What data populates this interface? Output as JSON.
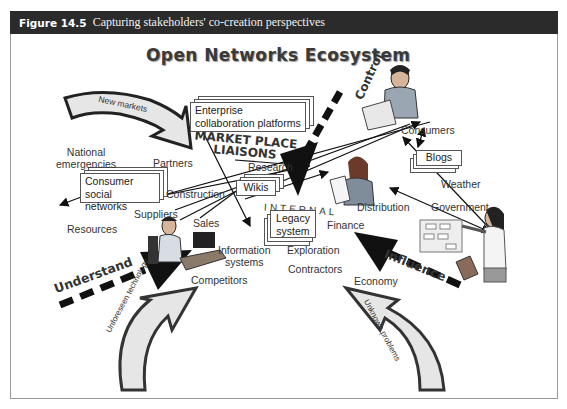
{
  "figure": {
    "number": "Figure 14.5",
    "caption": "Capturing stakeholders' co-creation perspectives"
  },
  "diagram": {
    "title": "Open Networks Ecosystem",
    "forces": {
      "control": "Control",
      "understand": "Understand",
      "influence": "Influence"
    },
    "curved_arrows": {
      "new_markets": "New markets",
      "unforeseen_technology": "Unforeseen technology",
      "unknown_problems": "Unknown problems"
    },
    "zones": {
      "market_place_line1": "MARKET PLACE",
      "market_place_line2": "LIAISONS",
      "internal": "INTERNAL"
    },
    "platform_boxes": {
      "enterprise_line1": "Enterprise",
      "enterprise_line2": "collaboration platforms",
      "consumer_line1": "Consumer",
      "consumer_line2": "social networks",
      "wikis": "Wikis",
      "legacy_line1": "Legacy",
      "legacy_line2": "system",
      "blogs": "Blogs"
    },
    "stakeholders": {
      "national_emergencies_line1": "National",
      "national_emergencies_line2": "emergencies",
      "partners": "Partners",
      "construction": "Construction",
      "suppliers": "Suppliers",
      "resources": "Resources",
      "sales": "Sales",
      "research": "Research",
      "information_systems_line1": "Information",
      "information_systems_line2": "systems",
      "exploration": "Exploration",
      "contractors": "Contractors",
      "competitors": "Competitors",
      "finance": "Finance",
      "distribution": "Distribution",
      "consumers": "Consumers",
      "weather": "Weather",
      "government": "Government",
      "economy": "Economy"
    },
    "figures": {
      "top_person": "man-reading-newspaper",
      "middle_person": "woman-with-document",
      "desk_person": "man-at-computer",
      "presenter": "woman-presenting-chart"
    }
  }
}
